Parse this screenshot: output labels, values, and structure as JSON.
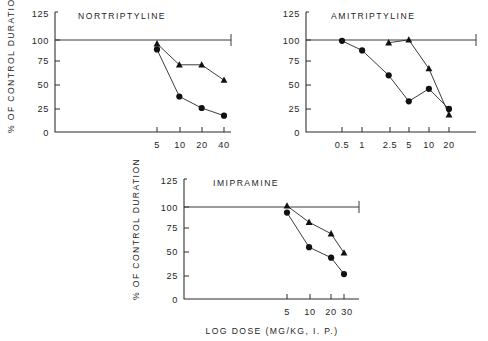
{
  "figure": {
    "background_color": "#ffffff",
    "ink_color": "#1a1a1a",
    "shared_ylabel": "% OF CONTROL DURATION",
    "shared_xlabel": "LOG DOSE (MG/KG, I. P.)",
    "y_ticks": [
      "0",
      "25",
      "50",
      "75",
      "100",
      "125"
    ],
    "reference_level_label": "100"
  },
  "chart_data": [
    {
      "type": "line",
      "title": "NORTRIPTYLINE",
      "xlabel": "LOG DOSE (MG/KG, I. P.)",
      "ylabel": "% OF CONTROL DURATION",
      "x_scale": "log",
      "categories": [
        "5",
        "10",
        "20",
        "40"
      ],
      "x": [
        5,
        10,
        20,
        40
      ],
      "ylim": [
        0,
        125
      ],
      "y_ticks": [
        0,
        25,
        50,
        75,
        100,
        125
      ],
      "grid": false,
      "legend": "none",
      "reference_line": 100,
      "series": [
        {
          "name": "triangle-series",
          "marker": "triangle",
          "x": [
            5,
            10,
            20,
            40
          ],
          "values": [
            92,
            70,
            70,
            54
          ]
        },
        {
          "name": "circle-series",
          "marker": "circle",
          "x": [
            5,
            10,
            20,
            40
          ],
          "values": [
            86,
            37,
            25,
            17
          ]
        }
      ]
    },
    {
      "type": "line",
      "title": "AMITRIPTYLINE",
      "xlabel": "LOG DOSE (MG/KG, I. P.)",
      "ylabel": "% OF CONTROL DURATION",
      "x_scale": "log",
      "categories": [
        "0.5",
        "1",
        "2.5",
        "5",
        "10",
        "20"
      ],
      "x": [
        0.5,
        1,
        2.5,
        5,
        10,
        20
      ],
      "ylim": [
        0,
        125
      ],
      "y_ticks": [
        0,
        25,
        50,
        75,
        100,
        125
      ],
      "grid": false,
      "legend": "none",
      "reference_line": 100,
      "series": [
        {
          "name": "triangle-series",
          "marker": "triangle",
          "x": [
            2.5,
            5,
            10,
            20
          ],
          "values": [
            93,
            96,
            66,
            18
          ]
        },
        {
          "name": "circle-series",
          "marker": "circle",
          "x": [
            0.5,
            1,
            2.5,
            5,
            10,
            20
          ],
          "values": [
            95,
            85,
            59,
            32,
            45,
            24
          ]
        }
      ]
    },
    {
      "type": "line",
      "title": "IMIPRAMINE",
      "xlabel": "LOG DOSE (MG/KG, I. P.)",
      "ylabel": "% OF CONTROL DURATION",
      "x_scale": "log",
      "categories": [
        "5",
        "10",
        "20",
        "30"
      ],
      "x": [
        5,
        10,
        20,
        30
      ],
      "ylim": [
        0,
        125
      ],
      "y_ticks": [
        0,
        25,
        50,
        75,
        100,
        125
      ],
      "grid": false,
      "legend": "none",
      "reference_line": 100,
      "series": [
        {
          "name": "triangle-series",
          "marker": "triangle",
          "x": [
            5,
            10,
            20,
            30
          ],
          "values": [
            97,
            80,
            68,
            48
          ]
        },
        {
          "name": "circle-series",
          "marker": "circle",
          "x": [
            5,
            10,
            20,
            30
          ],
          "values": [
            90,
            54,
            43,
            26
          ]
        }
      ]
    }
  ],
  "panels": {
    "nortriptyline": {
      "title": "NORTRIPTYLINE",
      "ylabel": "% OF CONTROL DURATION",
      "y_tick_0": "0",
      "y_tick_25": "25",
      "y_tick_50": "50",
      "y_tick_75": "75",
      "y_tick_100": "100",
      "y_tick_125": "125",
      "x_tick_1": "5",
      "x_tick_2": "10",
      "x_tick_3": "20",
      "x_tick_4": "40"
    },
    "amitriptyline": {
      "title": "AMITRIPTYLINE",
      "y_tick_0": "0",
      "y_tick_25": "25",
      "y_tick_50": "50",
      "y_tick_75": "75",
      "y_tick_100": "100",
      "y_tick_125": "125",
      "x_tick_1": "0.5",
      "x_tick_2": "1",
      "x_tick_3": "2.5",
      "x_tick_4": "5",
      "x_tick_5": "10",
      "x_tick_6": "20"
    },
    "imipramine": {
      "title": "IMIPRAMINE",
      "ylabel": "% OF CONTROL DURATION",
      "xlabel": "LOG DOSE (MG/KG, I. P.)",
      "y_tick_0": "0",
      "y_tick_25": "25",
      "y_tick_50": "50",
      "y_tick_75": "75",
      "y_tick_100": "100",
      "y_tick_125": "125",
      "x_tick_1": "5",
      "x_tick_2": "10",
      "x_tick_3": "20",
      "x_tick_4": "30"
    }
  }
}
